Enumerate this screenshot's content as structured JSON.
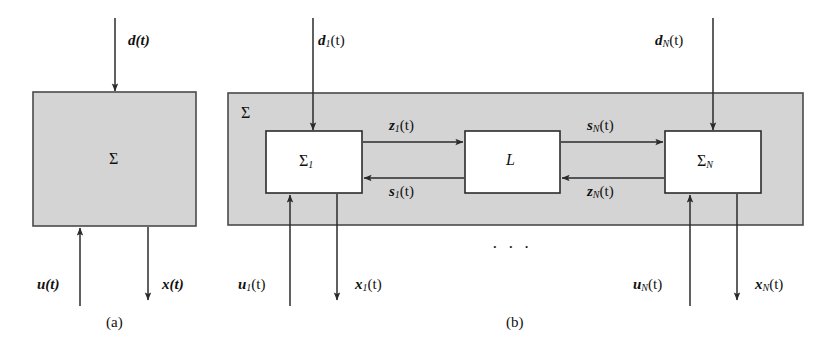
{
  "figure": {
    "type": "block-diagram",
    "colors": {
      "shaded_block_fill": "#d4d4d4",
      "inner_block_fill": "#ffffff",
      "line": "#2b2b2b",
      "background": "#ffffff"
    }
  },
  "panel_a": {
    "caption": "(a)",
    "outer_block_label": "Σ",
    "signals": {
      "disturbance": "d(t)",
      "input": "u(t)",
      "state": "x(t)"
    },
    "arrows": [
      {
        "name": "disturbance-in",
        "label": "d(t)",
        "direction": "down"
      },
      {
        "name": "input-in",
        "label": "u(t)",
        "direction": "up"
      },
      {
        "name": "state-out",
        "label": "x(t)",
        "direction": "down"
      }
    ]
  },
  "panel_b": {
    "caption": "(b)",
    "outer_block_label": "Σ",
    "ellipsis": "· · ·",
    "blocks": [
      {
        "name": "subsystem-1",
        "label_base": "Σ",
        "label_sub": "1"
      },
      {
        "name": "interconnection",
        "label_base": "L",
        "label_sub": ""
      },
      {
        "name": "subsystem-n",
        "label_base": "Σ",
        "label_sub": "N"
      }
    ],
    "signals": {
      "d1": "d₁(t)",
      "dN": "dₙ(t)",
      "u1": "u₁(t)",
      "uN": "uₙ(t)",
      "x1": "x₁(t)",
      "xN": "xₙ(t)",
      "z1": "z₁(t)",
      "s1": "s₁(t)",
      "sN": "sₙ(t)",
      "zN": "zₙ(t)"
    },
    "signal_parts": {
      "d1": {
        "base": "d",
        "sub": "1"
      },
      "dN": {
        "base": "d",
        "sub": "N"
      },
      "u1": {
        "base": "u",
        "sub": "1"
      },
      "uN": {
        "base": "u",
        "sub": "N"
      },
      "x1": {
        "base": "x",
        "sub": "1"
      },
      "xN": {
        "base": "x",
        "sub": "N"
      },
      "z1": {
        "base": "z",
        "sub": "1"
      },
      "s1": {
        "base": "s",
        "sub": "1"
      },
      "sN": {
        "base": "s",
        "sub": "N"
      },
      "zN": {
        "base": "z",
        "sub": "N"
      },
      "tail": "(t)"
    }
  }
}
